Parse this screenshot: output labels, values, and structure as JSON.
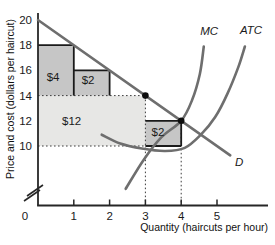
{
  "chart_data": {
    "type": "line",
    "title": "",
    "xlabel": "Quantity (haircuts per hour)",
    "ylabel": "Price and cost (dollars per haircut)",
    "x_ticks": [
      0,
      1,
      2,
      3,
      4,
      5
    ],
    "y_ticks": [
      10,
      12,
      14,
      16,
      18,
      20
    ],
    "xlim": [
      0,
      6.4
    ],
    "ylim": [
      10,
      20
    ],
    "y_axis_break": true,
    "grid": false,
    "series": [
      {
        "name": "D",
        "label": "D",
        "points": [
          [
            0,
            20
          ],
          [
            5.37,
            9.26
          ]
        ],
        "label_at": [
          5.62,
          8.75
        ],
        "note": "linear demand, price = 20 - 2Q, passes (1,18),(2,16),(3,14),(4,12)"
      },
      {
        "name": "MC",
        "label": "MC",
        "points": [
          [
            2.45,
            6.6
          ],
          [
            2.95,
            8.9
          ],
          [
            3.45,
            10.7
          ],
          [
            4.0,
            12.0
          ],
          [
            4.3,
            13.6
          ],
          [
            4.52,
            15.7
          ],
          [
            4.63,
            17.9
          ]
        ],
        "label_at": [
          4.78,
          19.1
        ]
      },
      {
        "name": "ATC",
        "label": "ATC",
        "points": [
          [
            1.78,
            10.9
          ],
          [
            2.3,
            10.2
          ],
          [
            2.9,
            9.8
          ],
          [
            3.55,
            9.6
          ],
          [
            4.1,
            9.85
          ],
          [
            4.55,
            10.9
          ],
          [
            4.95,
            12.3
          ],
          [
            5.3,
            14.2
          ],
          [
            5.6,
            16.3
          ],
          [
            5.78,
            17.9
          ]
        ],
        "label_at": [
          5.95,
          19.2
        ]
      }
    ],
    "rectangles": [
      {
        "label": "$12",
        "q1": 0,
        "p1": 10,
        "q2": 3,
        "p2": 14,
        "fill": "#e7e7e5",
        "solid_edges": [],
        "label_at": [
          0.94,
          12.0
        ]
      },
      {
        "label": "$4",
        "q1": 0,
        "p1": 14,
        "q2": 1,
        "p2": 18,
        "fill": "#c6c6c6",
        "solid_edges": [
          "top",
          "right"
        ],
        "label_at": [
          0.42,
          15.5
        ]
      },
      {
        "label": "$2",
        "q1": 1,
        "p1": 14,
        "q2": 2,
        "p2": 16,
        "fill": "#c6c6c6",
        "solid_edges": [
          "top",
          "right"
        ],
        "label_at": [
          1.4,
          15.2
        ]
      },
      {
        "label": "$2",
        "q1": 3,
        "p1": 10,
        "q2": 4,
        "p2": 12,
        "fill": "#c6c6c6",
        "solid_edges": [
          "top",
          "right",
          "bottom"
        ],
        "label_at": [
          3.35,
          11.1
        ]
      }
    ],
    "points": [
      {
        "q": 3,
        "p": 14
      },
      {
        "q": 4,
        "p": 12
      }
    ],
    "guides": [
      {
        "type": "h",
        "p": 14,
        "q1": 0,
        "q2": 3
      },
      {
        "type": "h",
        "p": 10,
        "q1": 0,
        "q2": 3
      },
      {
        "type": "v",
        "q": 3,
        "p1": 14
      },
      {
        "type": "v",
        "q": 4,
        "p1": 12
      }
    ],
    "colors": {
      "curve": "#6e6e6e",
      "axis": "#262626",
      "border": "#1a1a1a",
      "guide": "#3c3c3c",
      "dot": "#0d0d0d",
      "text": "#1a1a1a",
      "dark_rect": "#c6c6c6",
      "light_rect": "#e7e7e5",
      "background": "#ffffff"
    },
    "layout": {
      "x_origin_px": 38,
      "x_px_per_unit": 35.8,
      "y_top_value": 20,
      "y_top_px": 20,
      "y_px_per_dollar": 12.6,
      "y_axis_top_px": 13,
      "x_axis_y_px": 205.5,
      "x_axis_end_px": 268,
      "axis_break_y_px": 190,
      "zero_label_x_px": 25,
      "x_tick_label_y_px": 220
    }
  }
}
